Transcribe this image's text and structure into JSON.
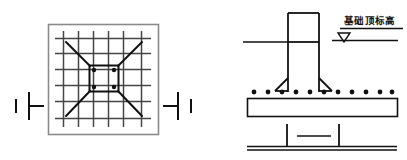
{
  "drawing": {
    "title": "Foundation plan and section detail",
    "background_color": "#ffffff",
    "line_color": "#1a1a1a",
    "grid_color": "#4a4a4a",
    "frame_color": "#808080",
    "width": 407,
    "height": 160
  },
  "plan_view": {
    "name": "foundation-plan-view",
    "frame": {
      "x": 48,
      "y": 24,
      "width": 110,
      "height": 110
    },
    "grid": {
      "vertical_lines": 6,
      "horizontal_lines": 6,
      "extent": {
        "x": 55,
        "y": 31,
        "width": 96,
        "height": 96
      }
    },
    "center_square": {
      "x": 86,
      "y": 62,
      "width": 36,
      "height": 30
    },
    "rebar_dots": [
      {
        "cx": 93,
        "cy": 70
      },
      {
        "cx": 114,
        "cy": 70
      },
      {
        "cx": 93,
        "cy": 85
      },
      {
        "cx": 114,
        "cy": 85
      }
    ],
    "diagonals": [
      {
        "x1": 68,
        "y1": 44,
        "x2": 90,
        "y2": 66
      },
      {
        "x1": 140,
        "y1": 44,
        "x2": 118,
        "y2": 66
      },
      {
        "x1": 68,
        "y1": 114,
        "x2": 90,
        "y2": 90
      },
      {
        "x1": 140,
        "y1": 114,
        "x2": 118,
        "y2": 90
      }
    ]
  },
  "section_markers": {
    "left": {
      "name": "section-marker-left",
      "x": 10,
      "y": 105
    },
    "right": {
      "name": "section-marker-right",
      "x": 172,
      "y": 105
    }
  },
  "section_view": {
    "name": "foundation-section-view",
    "column": {
      "x": 287,
      "y": 12,
      "width": 32,
      "height": 80
    },
    "column_inner_line_y": 42,
    "column_flare": {
      "left_x": 275,
      "right_x": 331,
      "base_y": 92,
      "start_y": 78
    },
    "ground_line": {
      "x1": 243,
      "y1": 42,
      "x2": 287,
      "y2": 42
    },
    "footing_slab": {
      "x": 247,
      "y": 98,
      "width": 150,
      "height": 18
    },
    "rebar_dot_count": 11,
    "rebar_dots_y": 92,
    "rebar_dots_x_start": 253,
    "rebar_dots_x_end": 389
  },
  "elevation_label": {
    "name": "elevation-annotation",
    "text": "基础顶标高",
    "text_x": 344,
    "text_y": 24,
    "underline": {
      "x1": 340,
      "y1": 28,
      "x2": 402,
      "y2": 28
    },
    "leader_line": {
      "x1": 332,
      "y1": 40,
      "x2": 397,
      "y2": 40
    },
    "triangle": {
      "cx": 344,
      "cy": 40,
      "size": 9
    }
  },
  "bottom_detail": {
    "name": "bottom-detail-view",
    "base_line": {
      "x1": 247,
      "y1": 148,
      "x2": 397,
      "y2": 148
    },
    "left_tick": {
      "x": 286,
      "y1": 124,
      "y2": 148
    },
    "right_tick": {
      "x": 338,
      "y1": 124,
      "y2": 148
    },
    "middle_line": {
      "x1": 297,
      "y1": 136,
      "x2": 330,
      "y2": 136
    }
  }
}
